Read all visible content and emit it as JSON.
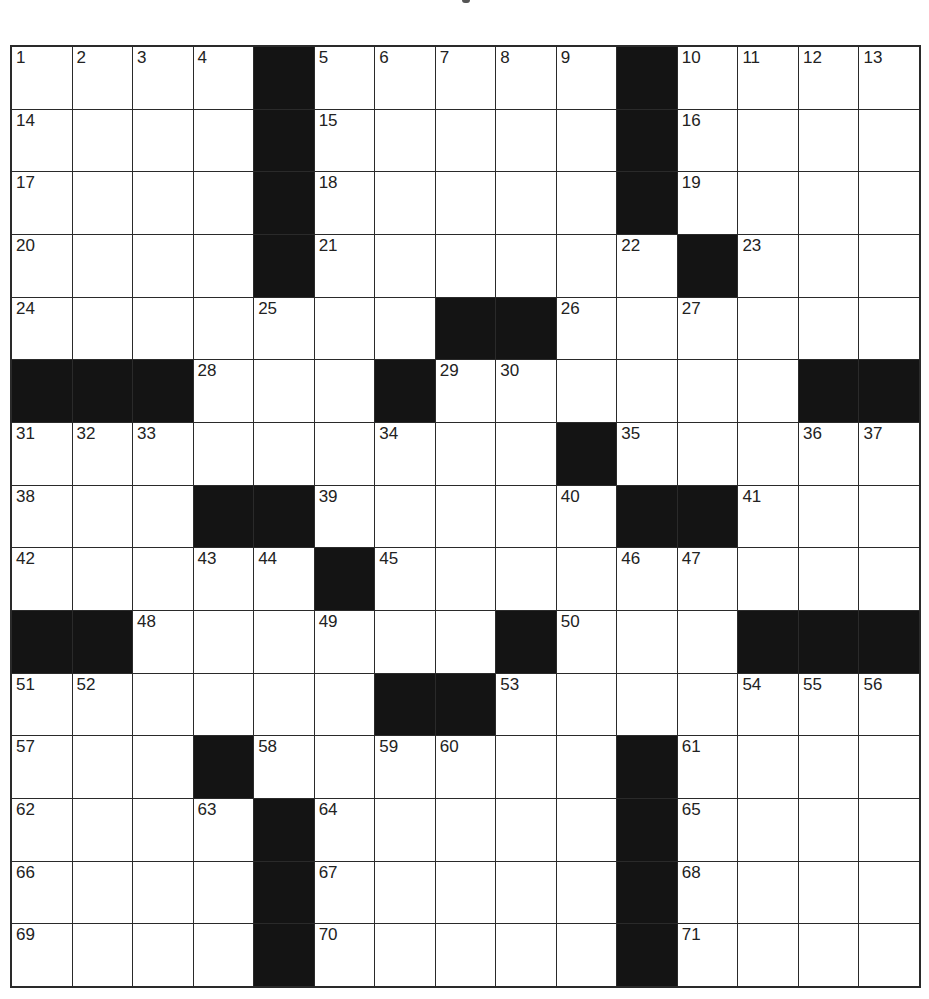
{
  "puzzle": {
    "rows": 15,
    "cols": 15,
    "grid_color": "#2a2a2a",
    "block_color": "#141414",
    "blocks": [
      [
        0,
        4
      ],
      [
        0,
        10
      ],
      [
        1,
        4
      ],
      [
        1,
        10
      ],
      [
        2,
        4
      ],
      [
        2,
        10
      ],
      [
        3,
        4
      ],
      [
        3,
        11
      ],
      [
        4,
        7
      ],
      [
        4,
        8
      ],
      [
        5,
        0
      ],
      [
        5,
        1
      ],
      [
        5,
        2
      ],
      [
        5,
        6
      ],
      [
        5,
        13
      ],
      [
        5,
        14
      ],
      [
        6,
        9
      ],
      [
        7,
        3
      ],
      [
        7,
        4
      ],
      [
        7,
        10
      ],
      [
        7,
        11
      ],
      [
        8,
        5
      ],
      [
        9,
        0
      ],
      [
        9,
        1
      ],
      [
        9,
        8
      ],
      [
        9,
        12
      ],
      [
        9,
        13
      ],
      [
        9,
        14
      ],
      [
        10,
        6
      ],
      [
        10,
        7
      ],
      [
        11,
        3
      ],
      [
        11,
        10
      ],
      [
        12,
        4
      ],
      [
        12,
        10
      ],
      [
        13,
        4
      ],
      [
        13,
        10
      ],
      [
        14,
        4
      ],
      [
        14,
        10
      ]
    ],
    "numbers": [
      {
        "r": 0,
        "c": 0,
        "n": "1"
      },
      {
        "r": 0,
        "c": 1,
        "n": "2"
      },
      {
        "r": 0,
        "c": 2,
        "n": "3"
      },
      {
        "r": 0,
        "c": 3,
        "n": "4"
      },
      {
        "r": 0,
        "c": 5,
        "n": "5"
      },
      {
        "r": 0,
        "c": 6,
        "n": "6"
      },
      {
        "r": 0,
        "c": 7,
        "n": "7"
      },
      {
        "r": 0,
        "c": 8,
        "n": "8"
      },
      {
        "r": 0,
        "c": 9,
        "n": "9"
      },
      {
        "r": 0,
        "c": 11,
        "n": "10"
      },
      {
        "r": 0,
        "c": 12,
        "n": "11"
      },
      {
        "r": 0,
        "c": 13,
        "n": "12"
      },
      {
        "r": 0,
        "c": 14,
        "n": "13"
      },
      {
        "r": 1,
        "c": 0,
        "n": "14"
      },
      {
        "r": 1,
        "c": 5,
        "n": "15"
      },
      {
        "r": 1,
        "c": 11,
        "n": "16"
      },
      {
        "r": 2,
        "c": 0,
        "n": "17"
      },
      {
        "r": 2,
        "c": 5,
        "n": "18"
      },
      {
        "r": 2,
        "c": 11,
        "n": "19"
      },
      {
        "r": 3,
        "c": 0,
        "n": "20"
      },
      {
        "r": 3,
        "c": 5,
        "n": "21"
      },
      {
        "r": 3,
        "c": 10,
        "n": "22"
      },
      {
        "r": 3,
        "c": 12,
        "n": "23"
      },
      {
        "r": 4,
        "c": 0,
        "n": "24"
      },
      {
        "r": 4,
        "c": 4,
        "n": "25"
      },
      {
        "r": 4,
        "c": 9,
        "n": "26"
      },
      {
        "r": 4,
        "c": 11,
        "n": "27"
      },
      {
        "r": 5,
        "c": 3,
        "n": "28"
      },
      {
        "r": 5,
        "c": 7,
        "n": "29"
      },
      {
        "r": 5,
        "c": 8,
        "n": "30"
      },
      {
        "r": 6,
        "c": 0,
        "n": "31"
      },
      {
        "r": 6,
        "c": 1,
        "n": "32"
      },
      {
        "r": 6,
        "c": 2,
        "n": "33"
      },
      {
        "r": 6,
        "c": 6,
        "n": "34"
      },
      {
        "r": 6,
        "c": 10,
        "n": "35"
      },
      {
        "r": 6,
        "c": 13,
        "n": "36"
      },
      {
        "r": 6,
        "c": 14,
        "n": "37"
      },
      {
        "r": 7,
        "c": 0,
        "n": "38"
      },
      {
        "r": 7,
        "c": 5,
        "n": "39"
      },
      {
        "r": 7,
        "c": 9,
        "n": "40"
      },
      {
        "r": 7,
        "c": 12,
        "n": "41"
      },
      {
        "r": 8,
        "c": 0,
        "n": "42"
      },
      {
        "r": 8,
        "c": 3,
        "n": "43"
      },
      {
        "r": 8,
        "c": 4,
        "n": "44"
      },
      {
        "r": 8,
        "c": 6,
        "n": "45"
      },
      {
        "r": 8,
        "c": 10,
        "n": "46"
      },
      {
        "r": 8,
        "c": 11,
        "n": "47"
      },
      {
        "r": 9,
        "c": 2,
        "n": "48"
      },
      {
        "r": 9,
        "c": 5,
        "n": "49"
      },
      {
        "r": 9,
        "c": 9,
        "n": "50"
      },
      {
        "r": 10,
        "c": 0,
        "n": "51"
      },
      {
        "r": 10,
        "c": 1,
        "n": "52"
      },
      {
        "r": 10,
        "c": 8,
        "n": "53"
      },
      {
        "r": 10,
        "c": 12,
        "n": "54"
      },
      {
        "r": 10,
        "c": 13,
        "n": "55"
      },
      {
        "r": 10,
        "c": 14,
        "n": "56"
      },
      {
        "r": 11,
        "c": 0,
        "n": "57"
      },
      {
        "r": 11,
        "c": 4,
        "n": "58"
      },
      {
        "r": 11,
        "c": 6,
        "n": "59"
      },
      {
        "r": 11,
        "c": 7,
        "n": "60"
      },
      {
        "r": 11,
        "c": 11,
        "n": "61"
      },
      {
        "r": 12,
        "c": 0,
        "n": "62"
      },
      {
        "r": 12,
        "c": 3,
        "n": "63"
      },
      {
        "r": 12,
        "c": 5,
        "n": "64"
      },
      {
        "r": 12,
        "c": 11,
        "n": "65"
      },
      {
        "r": 13,
        "c": 0,
        "n": "66"
      },
      {
        "r": 13,
        "c": 5,
        "n": "67"
      },
      {
        "r": 13,
        "c": 11,
        "n": "68"
      },
      {
        "r": 14,
        "c": 0,
        "n": "69"
      },
      {
        "r": 14,
        "c": 5,
        "n": "70"
      },
      {
        "r": 14,
        "c": 11,
        "n": "71"
      }
    ],
    "entries": {}
  }
}
